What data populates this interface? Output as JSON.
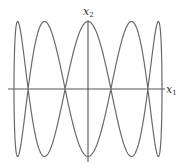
{
  "chart_data": {
    "type": "line",
    "title": "",
    "parametric": {
      "x1": "sin(t)",
      "x2": "cos(5t)",
      "t_range": [
        0,
        6.283185307
      ]
    },
    "frequency_ratio": "1:5",
    "xlabel": "x1",
    "ylabel": "x2",
    "xlim": [
      -1.1,
      1.25
    ],
    "ylim": [
      -1.1,
      1.1
    ],
    "grid": false,
    "legend": null,
    "series": [
      {
        "name": "trajectory",
        "color": "#6a6a6a"
      }
    ]
  },
  "labels": {
    "x1_var": "x",
    "x1_sub": "1",
    "x2_var": "x",
    "x2_sub": "2"
  },
  "geometry": {
    "origin": [
      88,
      89
    ],
    "half_width": 74,
    "half_height": 67.5,
    "axis_x_extent": [
      8,
      165
    ],
    "axis_y_extent": [
      20,
      162
    ]
  }
}
